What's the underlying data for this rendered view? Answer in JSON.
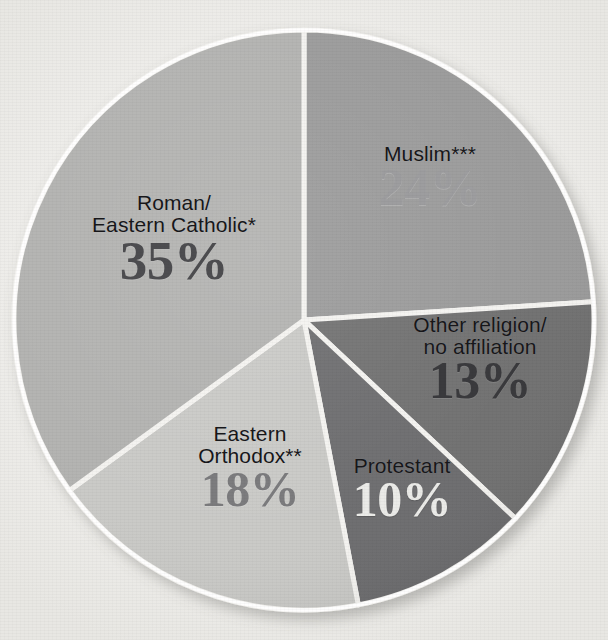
{
  "background": {
    "paper_color": "#f1f0ed",
    "bleed_text": {
      "top_left": " ",
      "top_right": " ",
      "bottom_left": " ",
      "bottom_right": " "
    }
  },
  "chart_data": {
    "type": "pie",
    "title": "",
    "xlabel": "",
    "ylabel": "",
    "legend_position": "none",
    "grid": false,
    "units": "percent",
    "start_angle_deg": 0,
    "direction": "clockwise",
    "categories": [
      "Muslim***",
      "Other religion/\nno affiliation",
      "Protestant",
      "Eastern\nOrthodox**",
      "Roman/\nEastern Catholic*"
    ],
    "values": [
      24,
      13,
      10,
      18,
      35
    ],
    "slices": [
      {
        "label": "Muslim***",
        "value_label": "24%",
        "value": 24,
        "color": "#9a9a9a",
        "value_text_tone": "midlt"
      },
      {
        "label": "Other religion/\nno affiliation",
        "value_label": "13%",
        "value": 13,
        "color": "#6f6f70",
        "value_text_tone": "deep"
      },
      {
        "label": "Protestant",
        "value_label": "10%",
        "value": 10,
        "color": "#6c6c6e",
        "value_text_tone": "light"
      },
      {
        "label": "Eastern\nOrthodox**",
        "value_label": "18%",
        "value": 18,
        "color": "#c9c9c6",
        "value_text_tone": "mid"
      },
      {
        "label": "Roman/\nEastern Catholic*",
        "value_label": "35%",
        "value": 35,
        "color": "#b2b2b0",
        "value_text_tone": "dark"
      }
    ],
    "separator_color": "#f4f3f0",
    "outline_color": "#ffffff",
    "total": 100
  },
  "geometry": {
    "center_x": 304,
    "center_y": 320,
    "radius": 290
  }
}
